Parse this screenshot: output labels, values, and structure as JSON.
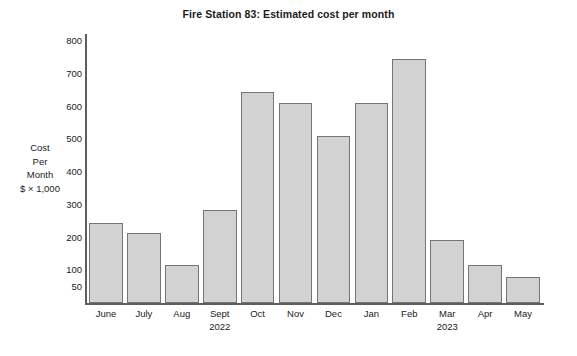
{
  "chart_data": {
    "type": "bar",
    "title": "Fire Station 83: Estimated cost per month",
    "xlabel": "",
    "ylabel": "Cost Per Month $ × 1,000",
    "ylabel_lines": [
      "Cost",
      "Per",
      "Month",
      "$ × 1,000"
    ],
    "categories": [
      "June",
      "July",
      "Aug",
      "Sept 2022",
      "Oct",
      "Nov",
      "Dec",
      "Jan",
      "Feb",
      "Mar 2023",
      "Apr",
      "May"
    ],
    "category_lines": [
      [
        "June"
      ],
      [
        "July"
      ],
      [
        "Aug"
      ],
      [
        "Sept",
        "2022"
      ],
      [
        "Oct"
      ],
      [
        "Nov"
      ],
      [
        "Dec"
      ],
      [
        "Jan"
      ],
      [
        "Feb"
      ],
      [
        "Mar",
        "2023"
      ],
      [
        "Apr"
      ],
      [
        "May"
      ]
    ],
    "values": [
      243,
      215,
      115,
      283,
      645,
      612,
      510,
      612,
      745,
      193,
      115,
      80
    ],
    "ylim": [
      0,
      800
    ],
    "yticks": [
      800,
      700,
      600,
      500,
      400,
      300,
      200,
      100,
      50
    ],
    "grid": false,
    "legend": null,
    "bar_color": "#d2d2d2",
    "bar_border_color": "#757575",
    "axis_color": "#5d5d5d",
    "text_color": "#1b1b1b"
  }
}
